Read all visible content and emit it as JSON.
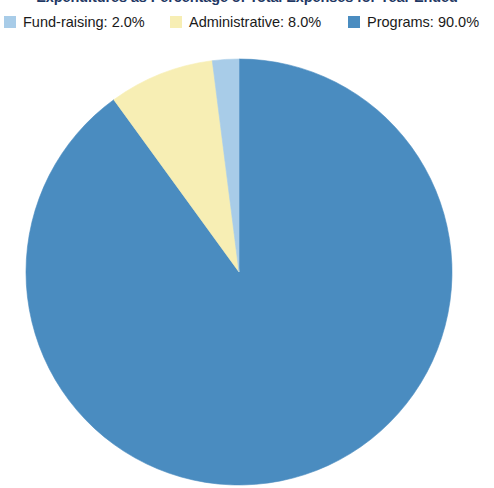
{
  "title": "Expenditures as Percentage of Total Expenses for Year Ended",
  "legend": {
    "position": "top",
    "items": [
      {
        "label": "Fund-raising: 2.0%",
        "name": "Fund-raising",
        "value": 2.0,
        "color": "#a8cce8"
      },
      {
        "label": "Administrative: 8.0%",
        "name": "Administrative",
        "value": 8.0,
        "color": "#f7eeb4"
      },
      {
        "label": "Programs: 90.0%",
        "name": "Programs",
        "value": 90.0,
        "color": "#4a8cc0"
      }
    ]
  },
  "chart_data": {
    "type": "pie",
    "title": "Expenditures as Percentage of Total Expenses for Year Ended",
    "xlabel": "",
    "ylabel": "",
    "unit": "%",
    "categories": [
      "Fund-raising",
      "Administrative",
      "Programs"
    ],
    "values": [
      2.0,
      8.0,
      90.0
    ],
    "labels": [
      "Fund-raising: 2.0%",
      "Administrative: 8.0%",
      "Programs: 90.0%"
    ],
    "colors": [
      "#a8cce8",
      "#f7eeb4",
      "#4a8cc0"
    ],
    "start_angle_deg": 0,
    "direction": "clockwise",
    "slice_order_clockwise": [
      "Programs",
      "Administrative",
      "Fund-raising"
    ],
    "legend_position": "top",
    "grid": false,
    "data_labels_shown": false,
    "geometry": {
      "center_x": 239,
      "center_y": 272,
      "radius": 213,
      "clipped_bottom": true
    }
  },
  "colors": {
    "background": "#ffffff",
    "title_text": "#1f3864",
    "legend_text": "#1a1a1a",
    "programs": "#4a8cc0",
    "administrative": "#f7eeb4",
    "fund_raising": "#a8cce8"
  }
}
